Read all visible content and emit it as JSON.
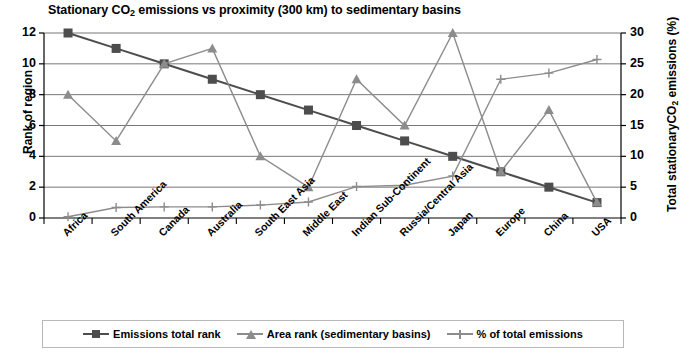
{
  "chart_data": {
    "type": "line",
    "title": "Stationary CO2 emissions vs proximity (300 km) to sedimentary basins",
    "title_prefix": "Stationary CO",
    "title_sub": "2",
    "title_suffix": " emissions vs proximity (300 km) to sedimentary basins",
    "xlabel": "",
    "ylabel": "Rank of region",
    "ylabel_right_prefix": "Total stationaryCO",
    "ylabel_right_sub": "2",
    "ylabel_right_suffix": " emissions (%)",
    "ylabel_right": "Total stationaryCO2 emissions (%)",
    "ylim": [
      0,
      12
    ],
    "ylim_right": [
      0,
      30
    ],
    "yticks": [
      "0",
      "2",
      "4",
      "6",
      "8",
      "10",
      "12"
    ],
    "yticks_right": [
      "0",
      "5",
      "10",
      "15",
      "20",
      "25",
      "30"
    ],
    "grid": true,
    "legend_position": "bottom",
    "categories": [
      "Africa",
      "South America",
      "Canada",
      "Australia",
      "South East Asia",
      "Middle East",
      "Indian Sub-Continent",
      "Russia/Central Asia",
      "Japan",
      "Europe",
      "China",
      "USA"
    ],
    "series": [
      {
        "name": "Emissions  total rank",
        "axis": "left",
        "marker": "square",
        "color": "#4d4d4d",
        "values": [
          12,
          11,
          10,
          9,
          8,
          7,
          6,
          5,
          4,
          3,
          2,
          1
        ]
      },
      {
        "name": "Area rank (sedimentary basins)",
        "axis": "left",
        "marker": "triangle",
        "color": "#8c8c8c",
        "values": [
          8,
          5,
          10,
          11,
          4,
          2,
          9,
          6,
          12,
          3,
          7,
          1
        ]
      },
      {
        "name": "% of total emissions",
        "axis": "right",
        "marker": "plus",
        "color": "#8c8c8c",
        "values": [
          0.2,
          1.7,
          1.8,
          1.8,
          2.1,
          2.6,
          5.1,
          5.3,
          6.8,
          22.5,
          23.5,
          25.7
        ]
      }
    ]
  },
  "legend": {
    "items": [
      {
        "label": "Emissions  total rank",
        "marker": "square"
      },
      {
        "label": "Area rank (sedimentary basins)",
        "marker": "triangle"
      },
      {
        "label": "% of total emissions",
        "marker": "plus"
      }
    ]
  },
  "colors": {
    "series_dark": "#4d4d4d",
    "series_gray": "#8c8c8c",
    "grid": "#777777",
    "axis": "#000000",
    "background": "#ffffff"
  }
}
